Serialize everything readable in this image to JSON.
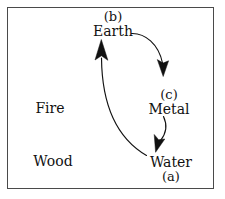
{
  "diagram": {
    "background_color": "#ffffff",
    "border_color": "#4a4a4a",
    "ink_color": "#111111",
    "nodes": [
      {
        "id": "earth",
        "tag": "(b)",
        "name": "Earth"
      },
      {
        "id": "metal",
        "tag": "(c)",
        "name": "Metal"
      },
      {
        "id": "water",
        "name": "Water",
        "tag": "(a)"
      },
      {
        "id": "fire",
        "name": "Fire"
      },
      {
        "id": "wood",
        "name": "Wood"
      }
    ],
    "edges": [
      {
        "id": "earth-to-metal",
        "from": "Earth",
        "to": "Metal"
      },
      {
        "id": "metal-to-water",
        "from": "Metal",
        "to": "Water"
      },
      {
        "id": "water-to-earth",
        "from": "Water",
        "to": "Earth"
      }
    ]
  }
}
